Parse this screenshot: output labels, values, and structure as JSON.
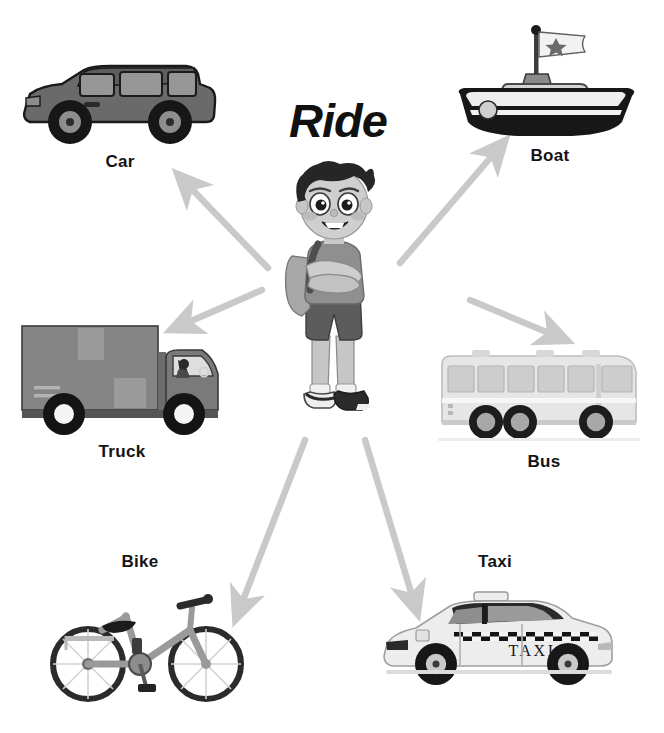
{
  "poster": {
    "title": "Ride",
    "background_color": "#ffffff",
    "text_color": "#141414",
    "arrow_color": "#c9c9c9",
    "style": "grayscale educational vocabulary poster"
  },
  "center": {
    "name": "boy-illustration",
    "description": "cartoon boy with dark spiky hair, backpack, crossed arms, t-shirt, shorts and sneakers",
    "hair_color": "#2a2a2a",
    "shirt_color": "#8d8d8d",
    "shorts_color": "#5e5e5e",
    "skin_color": "#c9c9c9"
  },
  "items": [
    {
      "id": "car",
      "label": "Car",
      "icon": "car-icon",
      "description": "gray minivan SUV facing left with tinted windows and alloy wheels",
      "body_color": "#6f6f6f",
      "glass_color": "#9a9a9a"
    },
    {
      "id": "boat",
      "label": "Boat",
      "icon": "boat-icon",
      "description": "tugboat with dark hull, white cabin and white flag with a star on the mast",
      "hull_color": "#1e1e1e",
      "cabin_color": "#d2d2d2"
    },
    {
      "id": "truck",
      "label": "Truck",
      "icon": "truck-icon",
      "description": "gray box delivery truck facing right with driver visible in cab",
      "body_color": "#7e7e7e",
      "box_color": "#8a8a8a"
    },
    {
      "id": "bus",
      "label": "Bus",
      "icon": "bus-icon",
      "description": "light gray coach bus facing right with a row of windows and three wheels",
      "body_color": "#e3e3e3",
      "glass_color": "#cfcfcf"
    },
    {
      "id": "bike",
      "label": "Bike",
      "icon": "bike-icon",
      "description": "gray city bicycle facing right with rear rack, black saddle and spoked wheels",
      "frame_color": "#9a9a9a",
      "tire_color": "#2b2b2b"
    },
    {
      "id": "taxi",
      "label": "Taxi",
      "icon": "taxi-icon",
      "description": "white sedan taxi facing left with checkered stripe, roof sign and TAXI lettering on door",
      "body_color": "#eeeeee",
      "door_text": "TAXI"
    }
  ],
  "arrows": [
    {
      "id": "arrow-to-car",
      "from": "boy",
      "to": "Car",
      "direction": "up-left"
    },
    {
      "id": "arrow-to-boat",
      "from": "boy",
      "to": "Boat",
      "direction": "up-right"
    },
    {
      "id": "arrow-to-truck",
      "from": "boy",
      "to": "Truck",
      "direction": "left"
    },
    {
      "id": "arrow-to-bus",
      "from": "boy",
      "to": "Bus",
      "direction": "right"
    },
    {
      "id": "arrow-to-bike",
      "from": "boy",
      "to": "Bike",
      "direction": "down-left"
    },
    {
      "id": "arrow-to-taxi",
      "from": "boy",
      "to": "Taxi",
      "direction": "down-right"
    }
  ]
}
